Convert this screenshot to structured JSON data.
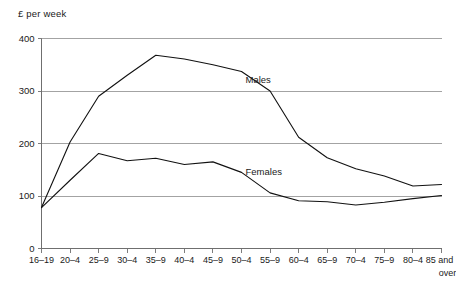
{
  "chart_data": {
    "type": "line",
    "title": "",
    "ylabel": "£ per week",
    "xlabel": "",
    "ylim": [
      0,
      400
    ],
    "yticks": [
      0,
      100,
      200,
      300,
      400
    ],
    "grid": true,
    "legend_position": "inline-annotation",
    "categories": [
      "16–19",
      "20–4",
      "25–9",
      "30–4",
      "35–9",
      "40–4",
      "45–9",
      "50–4",
      "55–9",
      "60–4",
      "65–9",
      "70–4",
      "75–9",
      "80–4",
      "85 and over"
    ],
    "category_last_line1": "85 and",
    "category_last_line2": "over",
    "series": [
      {
        "name": "Males",
        "values": [
          78,
          203,
          290,
          330,
          368,
          361,
          350,
          337,
          300,
          212,
          173,
          152,
          138,
          119,
          122
        ]
      },
      {
        "name": "Females",
        "values": [
          78,
          130,
          181,
          167,
          172,
          160,
          165,
          145,
          106,
          91,
          89,
          83,
          88,
          95,
          101
        ]
      }
    ],
    "annotations": [
      {
        "text": "Males",
        "x_category": "50–4",
        "y_value": 315
      },
      {
        "text": "Females",
        "x_category": "50–4",
        "y_value": 140
      }
    ]
  },
  "ytick_labels": [
    "0",
    "100",
    "200",
    "300",
    "400"
  ]
}
